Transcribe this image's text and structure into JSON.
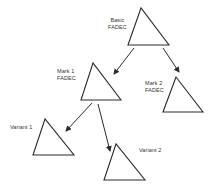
{
  "diagram": {
    "type": "hierarchy",
    "colors": {
      "stroke": "#2a2a2a",
      "text": "#333333",
      "background": "#ffffff"
    },
    "nodes": [
      {
        "id": "basic",
        "label_line1": "Basic",
        "label_line2": "FADEC",
        "shape": "triangle"
      },
      {
        "id": "mark1",
        "label_line1": "Mark 1",
        "label_line2": "FADEC",
        "shape": "triangle"
      },
      {
        "id": "mark2",
        "label_line1": "Mark 2",
        "label_line2": "FADEC",
        "shape": "triangle"
      },
      {
        "id": "variant1",
        "label_line1": "Variant 1",
        "shape": "triangle"
      },
      {
        "id": "variant2",
        "label_line1": "Variant 2",
        "shape": "triangle"
      }
    ],
    "edges": [
      {
        "from": "basic",
        "to": "mark1"
      },
      {
        "from": "basic",
        "to": "mark2"
      },
      {
        "from": "mark1",
        "to": "variant1"
      },
      {
        "from": "mark1",
        "to": "variant2"
      }
    ]
  }
}
